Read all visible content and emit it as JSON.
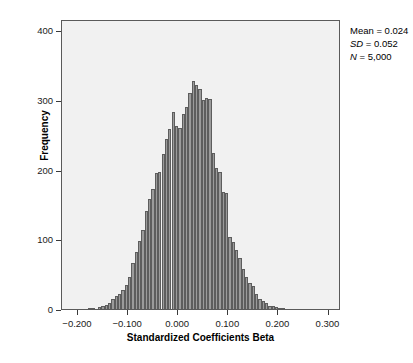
{
  "chart_data": {
    "type": "bar",
    "title": "",
    "subtitle": "",
    "xlabel": "Standardized Coefficients Beta",
    "ylabel": "Frequency",
    "xlim": [
      -0.232,
      0.325
    ],
    "ylim": [
      0,
      416
    ],
    "xticks": [
      "-0.200",
      "-0.100",
      "0.000",
      "0.100",
      "0.200",
      "0.300"
    ],
    "xtick_values": [
      -0.2,
      -0.1,
      0.0,
      0.1,
      0.2,
      0.3
    ],
    "yticks": [
      "0",
      "100",
      "200",
      "300",
      "400"
    ],
    "ytick_values": [
      0,
      100,
      200,
      300,
      400
    ],
    "grid": false,
    "legend": "none",
    "bin_width": 0.00667,
    "bar_color": "#9b9b9b",
    "bar_edge_color": "#5d5d5d",
    "plot_background": "#f1f1f1",
    "categories": [
      -0.1767,
      -0.17,
      -0.1633,
      -0.1567,
      -0.15,
      -0.1433,
      -0.1367,
      -0.13,
      -0.1233,
      -0.1167,
      -0.11,
      -0.1033,
      -0.0967,
      -0.09,
      -0.0833,
      -0.0767,
      -0.07,
      -0.0633,
      -0.0567,
      -0.05,
      -0.0433,
      -0.0367,
      -0.03,
      -0.0233,
      -0.0167,
      -0.01,
      -0.0033,
      0.0033,
      0.01,
      0.0167,
      0.0233,
      0.03,
      0.0367,
      0.0433,
      0.05,
      0.0567,
      0.0633,
      0.07,
      0.0767,
      0.0833,
      0.09,
      0.0967,
      0.1033,
      0.11,
      0.1167,
      0.1233,
      0.13,
      0.1367,
      0.1433,
      0.15,
      0.1567,
      0.1633,
      0.17,
      0.1767,
      0.1833,
      0.19,
      0.1967,
      0.2033,
      0.21
    ],
    "values": [
      2,
      2,
      0,
      3,
      5,
      6,
      8,
      14,
      18,
      22,
      27,
      35,
      46,
      66,
      82,
      98,
      113,
      140,
      158,
      172,
      195,
      196,
      223,
      244,
      258,
      283,
      262,
      260,
      280,
      290,
      310,
      327,
      322,
      316,
      300,
      302,
      301,
      224,
      202,
      197,
      168,
      166,
      103,
      96,
      84,
      73,
      58,
      46,
      38,
      33,
      22,
      15,
      12,
      8,
      5,
      4,
      3,
      2,
      1
    ],
    "annotations": {
      "mean_label": "Mean",
      "mean_value": "0.024",
      "sd_label": "SD",
      "sd_value": "0.052",
      "n_label": "N",
      "n_value": "5,000",
      "equals": "="
    }
  }
}
